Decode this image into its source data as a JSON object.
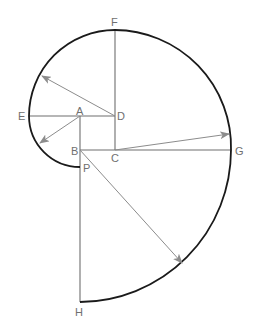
{
  "diagram": {
    "points": {
      "A": {
        "label": "A",
        "x": 80,
        "y": 116
      },
      "B": {
        "label": "B",
        "x": 80,
        "y": 150
      },
      "C": {
        "label": "C",
        "x": 115,
        "y": 150
      },
      "D": {
        "label": "D",
        "x": 115,
        "y": 116
      },
      "E": {
        "label": "E",
        "x": 29,
        "y": 116
      },
      "F": {
        "label": "F",
        "x": 115,
        "y": 31
      },
      "G": {
        "label": "G",
        "x": 231,
        "y": 150
      },
      "H": {
        "label": "H",
        "x": 80,
        "y": 302
      },
      "P": {
        "label": "P",
        "x": 80,
        "y": 167
      }
    },
    "arcs": [
      {
        "name": "arc-P-E",
        "center": "A",
        "radius": 51
      },
      {
        "name": "arc-E-F",
        "center": "D",
        "radius": 86
      },
      {
        "name": "arc-F-G",
        "center": "C",
        "radius": 117
      },
      {
        "name": "arc-G-H",
        "center": "B",
        "radius": 152
      }
    ],
    "radius_arrows": [
      {
        "from": "A",
        "to_xy": [
          40,
          143
        ]
      },
      {
        "from": "D",
        "to_xy": [
          42,
          76
        ]
      },
      {
        "from": "C",
        "to_xy": [
          229,
          134
        ]
      },
      {
        "from": "B",
        "to_xy": [
          182,
          263
        ]
      }
    ],
    "colors": {
      "curve": "#1a1a1a",
      "construction_lines": "#6e6e6e",
      "arrows": "#8c8c8c",
      "labels": "#707070"
    }
  }
}
